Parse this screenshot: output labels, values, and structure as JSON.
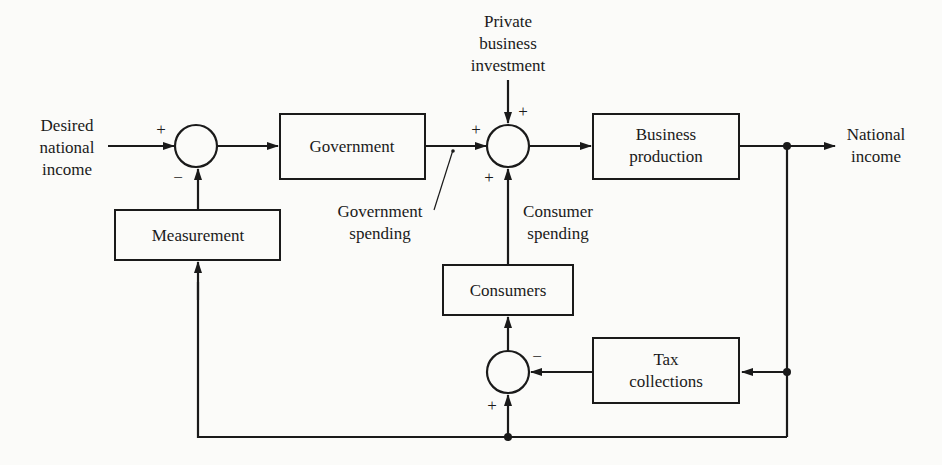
{
  "diagram": {
    "type": "block-diagram",
    "inputs": {
      "desired_income": [
        "Desired",
        "national",
        "income"
      ],
      "private_investment": [
        "Private",
        "business",
        "investment"
      ]
    },
    "output": [
      "National",
      "income"
    ],
    "blocks": {
      "government": "Government",
      "business_production": [
        "Business",
        "production"
      ],
      "measurement": "Measurement",
      "consumers": "Consumers",
      "tax_collections": [
        "Tax",
        "collections"
      ]
    },
    "annotations": {
      "government_spending": [
        "Government",
        "spending"
      ],
      "consumer_spending": [
        "Consumer",
        "spending"
      ]
    },
    "signs": {
      "plus": "+",
      "minus": "−"
    }
  }
}
